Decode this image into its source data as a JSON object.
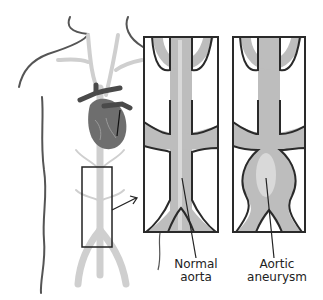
{
  "diagram": {
    "labels": {
      "normal_line1": "Normal",
      "normal_line2": "aorta",
      "aneurysm_line1": "Aortic",
      "aneurysm_line2": "aneurysm"
    },
    "colors": {
      "outline": "#2a2a2a",
      "vessel": "#bdbdbd",
      "vessel_light": "#d9d9d9",
      "vessel_dark": "#9a9a9a",
      "heart": "#6e6e6e",
      "heart_dark": "#4a4a4a",
      "body_outline": "#555555"
    },
    "panels": [
      {
        "name": "normal-aorta-panel"
      },
      {
        "name": "aortic-aneurysm-panel"
      }
    ]
  }
}
